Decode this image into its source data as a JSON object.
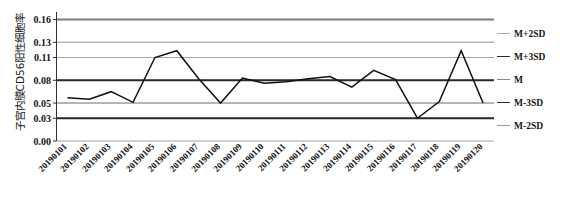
{
  "chart_data": {
    "type": "line",
    "title": "",
    "xlabel": "",
    "ylabel": "子宫内膜CD56阳性细胞率",
    "ylim": [
      0.0,
      0.17
    ],
    "yticks": [
      "0.16",
      "0.13",
      "0.11",
      "0.08",
      "0.05",
      "0.03",
      "0.00"
    ],
    "ytick_values": [
      0.16,
      0.13,
      0.11,
      0.08,
      0.05,
      0.03,
      0.0
    ],
    "grid": true,
    "legend_position": "right",
    "categories": [
      "20190101",
      "20190102",
      "20190103",
      "20190104",
      "20190105",
      "20190106",
      "20190107",
      "20190108",
      "20190109",
      "20190110",
      "20190111",
      "20190112",
      "20190113",
      "20190114",
      "20190115",
      "20190116",
      "20190117",
      "20190118",
      "20190119",
      "20190120"
    ],
    "series": [
      {
        "name": "M+3SD",
        "type": "control-limit",
        "value": 0.16,
        "color": "#7f7f7f",
        "values": [
          0.16,
          0.16,
          0.16,
          0.16,
          0.16,
          0.16,
          0.16,
          0.16,
          0.16,
          0.16,
          0.16,
          0.16,
          0.16,
          0.16,
          0.16,
          0.16,
          0.16,
          0.16,
          0.16,
          0.16
        ]
      },
      {
        "name": "M+2SD",
        "type": "control-limit",
        "value": 0.13,
        "color": "#b0b0b0",
        "values": [
          0.13,
          0.13,
          0.13,
          0.13,
          0.13,
          0.13,
          0.13,
          0.13,
          0.13,
          0.13,
          0.13,
          0.13,
          0.13,
          0.13,
          0.13,
          0.13,
          0.13,
          0.13,
          0.13,
          0.13
        ]
      },
      {
        "name": "M",
        "type": "control-limit",
        "value": 0.08,
        "color": "#2a2a2a",
        "values": [
          0.08,
          0.08,
          0.08,
          0.08,
          0.08,
          0.08,
          0.08,
          0.08,
          0.08,
          0.08,
          0.08,
          0.08,
          0.08,
          0.08,
          0.08,
          0.08,
          0.08,
          0.08,
          0.08,
          0.08
        ]
      },
      {
        "name": "M-3SD",
        "type": "control-limit",
        "value": 0.03,
        "color": "#2a2a2a",
        "values": [
          0.03,
          0.03,
          0.03,
          0.03,
          0.03,
          0.03,
          0.03,
          0.03,
          0.03,
          0.03,
          0.03,
          0.03,
          0.03,
          0.03,
          0.03,
          0.03,
          0.03,
          0.03,
          0.03,
          0.03
        ]
      },
      {
        "name": "M-2SD",
        "type": "control-limit",
        "value": 0.05,
        "color": "#9a9a9a",
        "values": [
          0.05,
          0.05,
          0.05,
          0.05,
          0.05,
          0.05,
          0.05,
          0.05,
          0.05,
          0.05,
          0.05,
          0.05,
          0.05,
          0.05,
          0.05,
          0.05,
          0.05,
          0.05,
          0.05,
          0.05
        ]
      },
      {
        "name": "data",
        "type": "measurement",
        "color": "#111111",
        "values": [
          0.057,
          0.055,
          0.065,
          0.051,
          0.11,
          0.119,
          0.082,
          0.05,
          0.083,
          0.076,
          0.078,
          0.082,
          0.085,
          0.071,
          0.093,
          0.081,
          0.03,
          0.052,
          0.119,
          0.05
        ]
      }
    ]
  },
  "legend": {
    "items": [
      {
        "label": "M+2SD",
        "color": "#b0b0b0",
        "width": "1.2px"
      },
      {
        "label": "M+3SD",
        "color": "#2a2a2a",
        "width": "1.8px"
      },
      {
        "label": "M",
        "color": "#8a8a8a",
        "width": "1.4px"
      },
      {
        "label": "M-3SD",
        "color": "#2a2a2a",
        "width": "1.8px"
      },
      {
        "label": "M-2SD",
        "color": "#9a9a9a",
        "width": "1.4px"
      }
    ]
  },
  "axis": {
    "y_title": "子宫内膜CD56阳性细胞率"
  }
}
